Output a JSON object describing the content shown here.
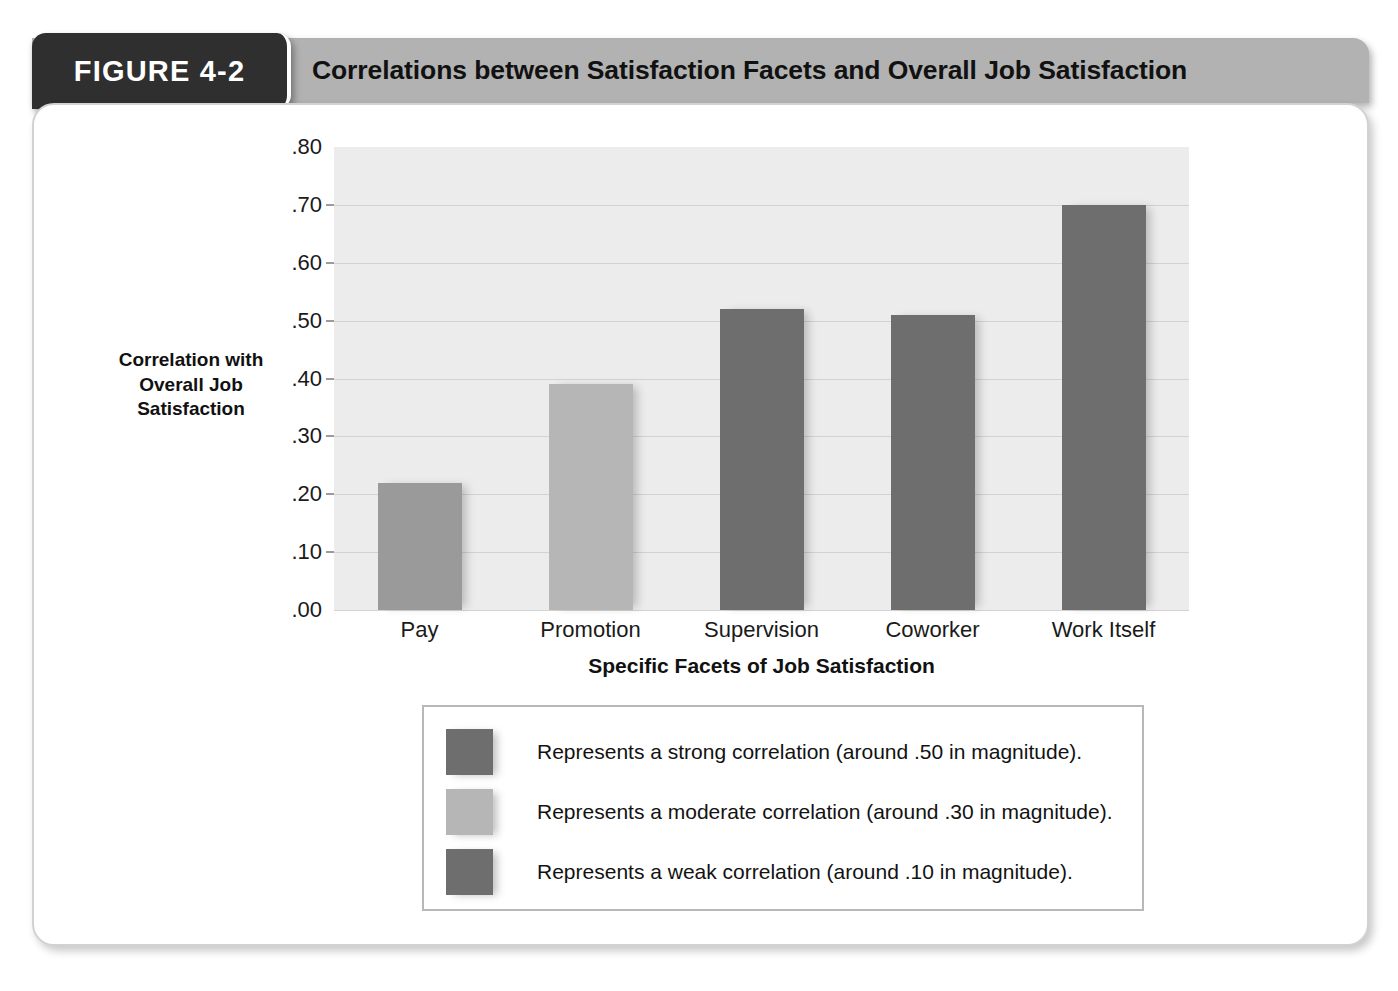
{
  "figure": {
    "badge_label": "FIGURE 4-2",
    "title": "Correlations between Satisfaction Facets and Overall Job Satisfaction"
  },
  "colors": {
    "badge_bg": "#2f2f2f",
    "header_band": "#b2b2b2",
    "plot_bg": "#ececec",
    "gridline": "#d2d2d2",
    "bar_dark": "#6e6e6e",
    "bar_medium": "#9a9a9a",
    "bar_light": "#b6b6b6"
  },
  "chart_data": {
    "type": "bar",
    "title": "Correlations between Satisfaction Facets and Overall Job Satisfaction",
    "xlabel": "Specific Facets of Job Satisfaction",
    "ylabel": "Correlation with Overall Job Satisfaction",
    "ylabel_lines": [
      "Correlation with",
      "Overall Job",
      "Satisfaction"
    ],
    "categories": [
      "Pay",
      "Promotion",
      "Supervision",
      "Coworker",
      "Work Itself"
    ],
    "values": [
      0.22,
      0.39,
      0.52,
      0.51,
      0.7
    ],
    "bar_colors": [
      "#9a9a9a",
      "#b6b6b6",
      "#6e6e6e",
      "#6e6e6e",
      "#6e6e6e"
    ],
    "ylim": [
      0.0,
      0.8
    ],
    "ytick_values": [
      0.8,
      0.7,
      0.6,
      0.5,
      0.4,
      0.3,
      0.2,
      0.1,
      0.0
    ],
    "ytick_labels": [
      ".80",
      ".70",
      ".60",
      ".50",
      ".40",
      ".30",
      ".20",
      ".10",
      ".00"
    ],
    "grid": true,
    "legend_position": "below-plot"
  },
  "legend": {
    "entries": [
      {
        "swatch_color": "#6e6e6e",
        "label": "Represents a strong correlation (around .50 in magnitude)."
      },
      {
        "swatch_color": "#b6b6b6",
        "label": "Represents a moderate correlation (around .30 in magnitude)."
      },
      {
        "swatch_color": "#6e6e6e",
        "label": "Represents a weak correlation (around .10 in magnitude)."
      }
    ]
  }
}
